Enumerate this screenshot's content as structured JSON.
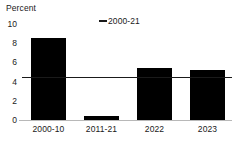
{
  "chart_data": {
    "type": "bar",
    "title": "",
    "ylabel": "Percent",
    "xlabel": "",
    "ylim": [
      0,
      10
    ],
    "yticks": [
      "0",
      "2",
      "4",
      "6",
      "8",
      "10"
    ],
    "grid": false,
    "legend_position": "top-center",
    "categories": [
      "2000-10",
      "2011-21",
      "2022",
      "2023"
    ],
    "values": [
      8.5,
      0.4,
      5.4,
      5.2
    ],
    "series": [
      {
        "name": "Annual growth",
        "type": "bar",
        "color": "#000000",
        "values": [
          8.5,
          0.4,
          5.4,
          5.2
        ]
      },
      {
        "name": "2000-21",
        "type": "reference-line",
        "color": "#1a1a1a",
        "value": 4.5
      }
    ],
    "legend": [
      {
        "marker": "line-dash-marker",
        "label": "2000-21"
      }
    ]
  },
  "axis": {
    "unit_title": "Percent"
  }
}
